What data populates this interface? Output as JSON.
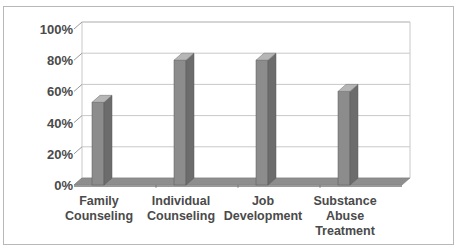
{
  "chart_data": {
    "type": "bar",
    "style": "3d-column",
    "title": "",
    "xlabel": "",
    "ylabel": "",
    "categories": [
      "Family Counseling",
      "Individual Counseling",
      "Job Development",
      "Substance Abuse Treatment"
    ],
    "category_lines": [
      [
        "Family",
        "Counseling"
      ],
      [
        "Individual",
        "Counseling"
      ],
      [
        "Job",
        "Development"
      ],
      [
        "Substance",
        "Abuse",
        "Treatment"
      ]
    ],
    "values": [
      53,
      80,
      80,
      60
    ],
    "ylim": [
      0,
      100
    ],
    "yticks": [
      "0%",
      "20%",
      "40%",
      "60%",
      "80%",
      "100%"
    ],
    "grid": true,
    "legend": null
  },
  "colors": {
    "bar_front": "#8c8c8c",
    "bar_side": "#6c6c6c",
    "bar_top": "#b6b6b6",
    "floor": "#8e8e8e",
    "grid": "#c8c8c8",
    "text": "#4a4a4a",
    "frame": "#b8b8b8"
  }
}
